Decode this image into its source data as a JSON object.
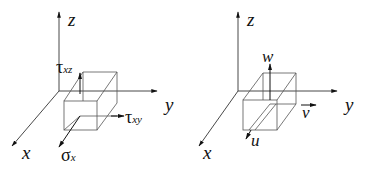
{
  "figure": {
    "colors": {
      "lines": "#333333",
      "box": "#555555",
      "text": "#111111",
      "background": "#ffffff"
    }
  },
  "left_panel": {
    "axes": {
      "x": "x",
      "y": "y",
      "z": "z"
    },
    "vectors": {
      "tau_xz": {
        "symbol": "τ",
        "subscript": "xz"
      },
      "tau_xy": {
        "symbol": "τ",
        "subscript": "xy"
      },
      "sigma_x": {
        "symbol": "σ",
        "subscript": "x"
      }
    }
  },
  "right_panel": {
    "axes": {
      "x": "x",
      "y": "y",
      "z": "z"
    },
    "vectors": {
      "w": "w",
      "v": "v",
      "u": "u"
    }
  }
}
